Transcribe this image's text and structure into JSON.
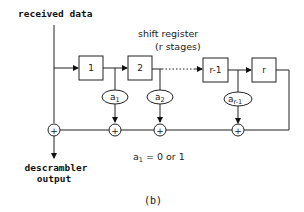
{
  "diagram": {
    "input_label": "received data",
    "output_label_line1": "descrambler",
    "output_label_line2": "output",
    "register_title_line1": "shift register",
    "register_title_line2": "(r stages)",
    "stages": [
      {
        "label": "1"
      },
      {
        "label": "2"
      },
      {
        "label": "r-1"
      },
      {
        "label": "r"
      }
    ],
    "coefficients": [
      {
        "base": "a",
        "sub": "1"
      },
      {
        "base": "a",
        "sub": "2"
      },
      {
        "base": "a",
        "sub": "r-1"
      }
    ],
    "xor_symbol": "+",
    "note_base": "a",
    "note_sub": "1",
    "note_rest": " = 0 or 1",
    "caption": "(b)"
  }
}
